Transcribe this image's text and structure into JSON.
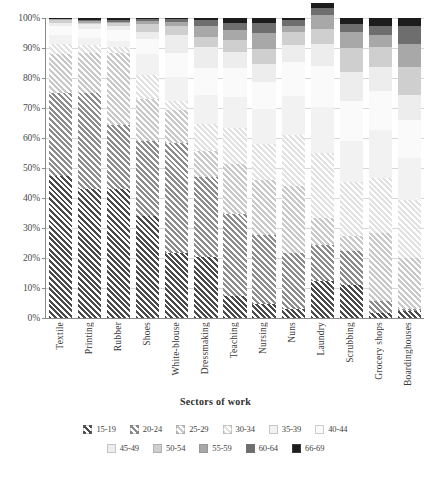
{
  "chart_data": {
    "type": "bar",
    "subtype": "stacked-percentage",
    "title": "",
    "xlabel": "Sectors of work",
    "ylabel": "",
    "ylim": [
      0,
      100
    ],
    "grid": true,
    "legend_position": "bottom",
    "y_tick_labels": [
      "0%",
      "10%",
      "20%",
      "30%",
      "40%",
      "50%",
      "60%",
      "70%",
      "80%",
      "90%",
      "100%"
    ],
    "y_ticks": [
      0,
      10,
      20,
      30,
      40,
      50,
      60,
      70,
      80,
      90,
      100
    ],
    "categories": [
      "Textile",
      "Printing",
      "Rubber",
      "Shoes",
      "White-blouse",
      "Dressmaking",
      "Teaching",
      "Nursing",
      "Nuns",
      "Laundry",
      "Scrubbing",
      "Grocery shops",
      "Boardinghouses"
    ],
    "series": [
      {
        "name": "15-19",
        "color": "#4a4a4a",
        "pattern": "hatch",
        "values": [
          47.5,
          43.0,
          43.0,
          34.0,
          21.8,
          20.3,
          7.3,
          4.8,
          3.0,
          12.2,
          11.0,
          1.8,
          2.4
        ]
      },
      {
        "name": "20-24",
        "color": "#8c8c8c",
        "pattern": "hatch",
        "values": [
          27.5,
          32.0,
          21.5,
          25.0,
          36.5,
          26.8,
          27.5,
          22.8,
          18.8,
          12.2,
          11.5,
          4.0,
          0.6
        ]
      },
      {
        "name": "25-29",
        "color": "#c9c9c9",
        "pattern": "hatch",
        "values": [
          13.0,
          13.5,
          24.0,
          14.0,
          11.0,
          8.5,
          16.5,
          18.5,
          22.2,
          9.0,
          5.0,
          22.4,
          17.0
        ]
      },
      {
        "name": "30-34",
        "color": "#e2e2e2",
        "pattern": "hatch",
        "values": [
          3.5,
          2.5,
          2.0,
          8.0,
          3.0,
          9.2,
          12.0,
          12.0,
          17.0,
          21.5,
          18.0,
          18.5,
          19.5
        ]
      },
      {
        "name": "35-39",
        "color": "#f2f2f2",
        "pattern": "solid",
        "values": [
          3.0,
          2.5,
          2.0,
          7.0,
          8.0,
          9.5,
          10.5,
          11.5,
          13.0,
          15.5,
          13.5,
          16.0,
          14.0
        ]
      },
      {
        "name": "40-44",
        "color": "#fafafa",
        "pattern": "solid",
        "values": [
          3.0,
          3.0,
          3.5,
          5.0,
          8.0,
          9.2,
          9.5,
          9.0,
          11.5,
          13.5,
          13.5,
          13.0,
          12.5
        ]
      },
      {
        "name": "45-49",
        "color": "#ededed",
        "pattern": "solid",
        "values": [
          1.0,
          1.5,
          1.5,
          2.5,
          6.0,
          6.8,
          5.5,
          6.0,
          5.5,
          7.5,
          9.5,
          8.0,
          8.5
        ]
      },
      {
        "name": "50-54",
        "color": "#cfcfcf",
        "pattern": "solid",
        "values": [
          0.7,
          0.5,
          0.8,
          2.5,
          3.0,
          3.5,
          4.0,
          5.0,
          4.5,
          5.0,
          8.0,
          6.5,
          9.2
        ]
      },
      {
        "name": "55-59",
        "color": "#a8a8a8",
        "pattern": "solid",
        "values": [
          0.5,
          0.4,
          0.5,
          1.0,
          1.5,
          3.5,
          3.2,
          5.4,
          2.0,
          4.5,
          5.5,
          4.0,
          7.8
        ]
      },
      {
        "name": "60-64",
        "color": "#6e6e6e",
        "pattern": "solid",
        "values": [
          0.2,
          0.3,
          0.6,
          0.7,
          1.0,
          1.9,
          2.5,
          3.5,
          1.8,
          2.5,
          2.5,
          3.3,
          6.0
        ]
      },
      {
        "name": "66-69",
        "color": "#1c1c1c",
        "pattern": "solid",
        "values": [
          0.1,
          0.8,
          0.6,
          0.3,
          0.2,
          0.8,
          1.5,
          1.5,
          0.7,
          1.6,
          2.0,
          2.5,
          2.5
        ]
      }
    ]
  },
  "legend": {
    "row1": [
      "15-19",
      "20-24",
      "25-29",
      "30-34",
      "35-39",
      "40-44"
    ],
    "row2": [
      "45-49",
      "50-54",
      "55-59",
      "60-64",
      "66-69"
    ]
  },
  "axis": {
    "x_title": "Sectors of work"
  }
}
